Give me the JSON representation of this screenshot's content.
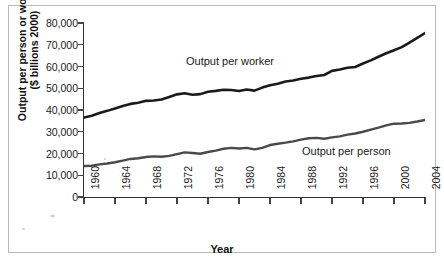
{
  "chart_data": {
    "type": "line",
    "title": "",
    "xlabel": "Year",
    "ylabel": "Output per person or worker ($ billions 2000)",
    "ylabel_line1": "Output per person or worker",
    "ylabel_line2": "($ billions 2000)",
    "xlim": [
      1960,
      2004
    ],
    "ylim": [
      0,
      80000
    ],
    "grid": false,
    "legend_position": "inline-annotations",
    "ytick_labels": [
      "80,000",
      "70,000",
      "60,000",
      "50,000",
      "40,000",
      "30,000",
      "20,000",
      "10,000",
      "0"
    ],
    "ytick_values": [
      80000,
      70000,
      60000,
      50000,
      40000,
      30000,
      20000,
      10000,
      0
    ],
    "xtick_labels": [
      "1960",
      "1964",
      "1968",
      "1972",
      "1976",
      "1980",
      "1984",
      "1988",
      "1992",
      "1996",
      "2000",
      "2004"
    ],
    "xtick_values": [
      1960,
      1964,
      1968,
      1972,
      1976,
      1980,
      1984,
      1988,
      1992,
      1996,
      2000,
      2004
    ],
    "x": [
      1960,
      1961,
      1962,
      1963,
      1964,
      1965,
      1966,
      1967,
      1968,
      1969,
      1970,
      1971,
      1972,
      1973,
      1974,
      1975,
      1976,
      1977,
      1978,
      1979,
      1980,
      1981,
      1982,
      1983,
      1984,
      1985,
      1986,
      1987,
      1988,
      1989,
      1990,
      1991,
      1992,
      1993,
      1994,
      1995,
      1996,
      1997,
      1998,
      1999,
      2000,
      2001,
      2002,
      2003,
      2004
    ],
    "series": [
      {
        "name": "Output per worker",
        "color": "#1a1a1a",
        "width": 2.6,
        "values": [
          36500,
          37400,
          38600,
          39600,
          40700,
          41800,
          42800,
          43300,
          44200,
          44400,
          44800,
          46000,
          47200,
          47700,
          47000,
          47300,
          48400,
          48800,
          49300,
          49200,
          48700,
          49400,
          48900,
          50300,
          51400,
          52100,
          53100,
          53600,
          54400,
          54900,
          55600,
          56100,
          58000,
          58600,
          59400,
          59800,
          61400,
          62800,
          64500,
          66100,
          67500,
          68900,
          71000,
          73200,
          75400
        ]
      },
      {
        "name": "Output per person",
        "color": "#4a4a4a",
        "width": 2.4,
        "values": [
          14250,
          14400,
          15000,
          15400,
          16000,
          16700,
          17500,
          17800,
          18400,
          18700,
          18500,
          18900,
          19700,
          20500,
          20200,
          19900,
          20700,
          21300,
          22200,
          22600,
          22300,
          22600,
          21900,
          22600,
          23900,
          24500,
          25000,
          25600,
          26400,
          27000,
          27200,
          26800,
          27400,
          27900,
          28700,
          29200,
          30000,
          31000,
          31900,
          32900,
          33700,
          33800,
          34100,
          34700,
          35400
        ]
      }
    ],
    "annotations": [
      {
        "text": "Output per worker",
        "series": "Output per worker"
      },
      {
        "text": "Output per person",
        "series": "Output per person"
      }
    ]
  },
  "axis": {
    "x_title": "Year",
    "y_title_line1": "Output per person or worker",
    "y_title_line2": "($ billions 2000)"
  }
}
